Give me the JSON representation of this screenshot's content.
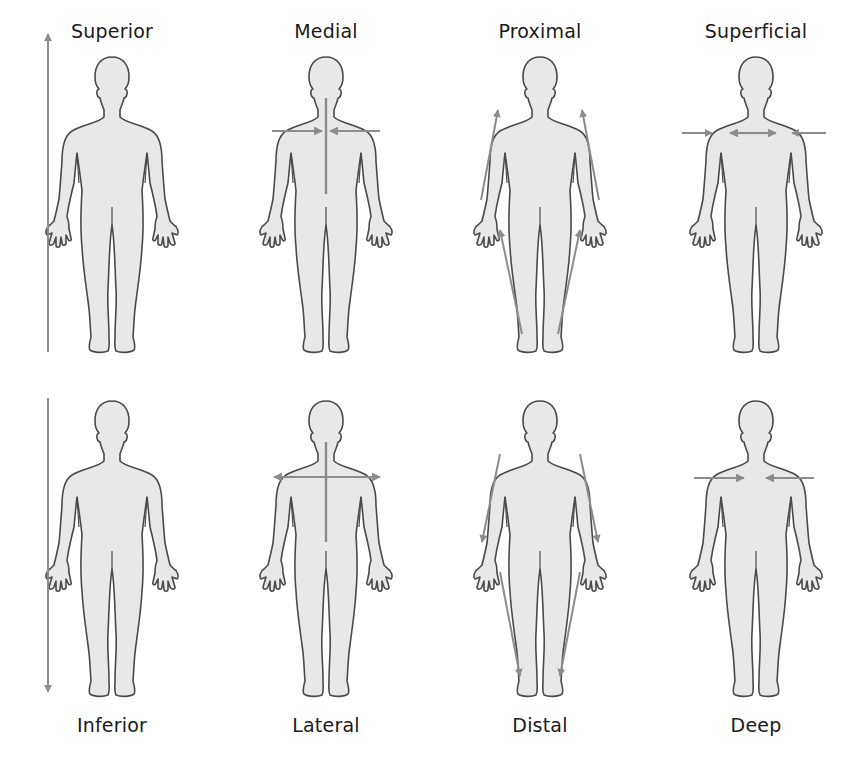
{
  "colors": {
    "body_fill": "#e8e8e8",
    "body_outline": "#4a4a4a",
    "arrow": "#8c8c8c",
    "text": "#1a1a1a"
  },
  "top_row": [
    {
      "label": "Superior",
      "arrow": "vertical-up-full-height"
    },
    {
      "label": "Medial",
      "arrow": "horizontal-converging-to-midline"
    },
    {
      "label": "Proximal",
      "arrow": "limbs-pointing-toward-trunk"
    },
    {
      "label": "Superficial",
      "arrow": "outward-toward-surface"
    }
  ],
  "bottom_row": [
    {
      "label": "Inferior",
      "arrow": "vertical-down-full-height"
    },
    {
      "label": "Lateral",
      "arrow": "horizontal-diverging-from-midline"
    },
    {
      "label": "Distal",
      "arrow": "limbs-pointing-away-from-trunk"
    },
    {
      "label": "Deep",
      "arrow": "inward-toward-center"
    }
  ]
}
